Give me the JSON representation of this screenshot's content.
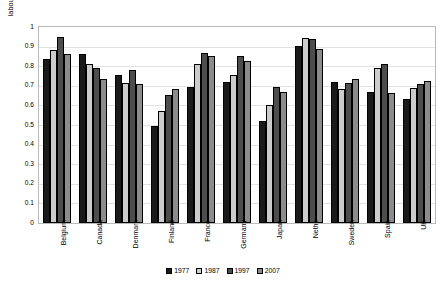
{
  "chart_data": {
    "type": "bar",
    "title": "",
    "xlabel": "",
    "ylabel": "labour productivity relative to the US",
    "ylim": [
      0,
      1
    ],
    "ytick_labels": [
      "1",
      "0.9",
      "0.8",
      "0.7",
      "0.6",
      "0.5",
      "0.4",
      "0.3",
      "0.2",
      "0.1",
      "0"
    ],
    "ytick_values": [
      1,
      0.9,
      0.8,
      0.7,
      0.6,
      0.5,
      0.4,
      0.3,
      0.2,
      0.1,
      0
    ],
    "grid": true,
    "legend_position": "bottom",
    "categories": [
      "Belgium",
      "Canada",
      "Denmark",
      "Finland",
      "France",
      "Germany",
      "Japan",
      "Neths",
      "Sweden",
      "Spain",
      "UK"
    ],
    "series": [
      {
        "name": "1977",
        "color": "#1a1a1a",
        "values": [
          0.835,
          0.86,
          0.755,
          0.495,
          0.695,
          0.72,
          0.52,
          0.905,
          0.72,
          0.67,
          0.635
        ]
      },
      {
        "name": "1987",
        "color": "#cccccc",
        "values": [
          0.885,
          0.81,
          0.715,
          0.57,
          0.81,
          0.755,
          0.6,
          0.945,
          0.685,
          0.79,
          0.69
        ]
      },
      {
        "name": "1997",
        "color": "#4d4d4d",
        "values": [
          0.95,
          0.79,
          0.78,
          0.655,
          0.865,
          0.85,
          0.695,
          0.94,
          0.715,
          0.81,
          0.71
        ]
      },
      {
        "name": "2007",
        "color": "#8c8c8c",
        "values": [
          0.86,
          0.735,
          0.71,
          0.685,
          0.85,
          0.825,
          0.67,
          0.89,
          0.735,
          0.665,
          0.725
        ]
      }
    ]
  }
}
